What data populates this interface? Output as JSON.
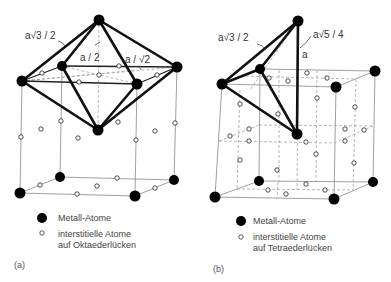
{
  "figure_a": {
    "caption": "(a)",
    "labels": {
      "edge_long": "a√3 / 2",
      "half": "a / 2",
      "diag": "a / √2"
    },
    "legend": {
      "metal": "Metall-Atome",
      "interstitial_line1": "interstitielle Atome",
      "interstitial_line2": "auf Oktaederlücken"
    }
  },
  "figure_b": {
    "caption": "(b)",
    "labels": {
      "edge_long": "a√3 / 2",
      "diag": "a√5 / 4",
      "height": "a"
    },
    "legend": {
      "metal": "Metall-Atome",
      "interstitial_line1": "interstitielle Atome",
      "interstitial_line2": "auf Tetraederlücken"
    }
  },
  "colors": {
    "line": "#111111",
    "thin_line": "#777777",
    "background": "#ffffff"
  }
}
